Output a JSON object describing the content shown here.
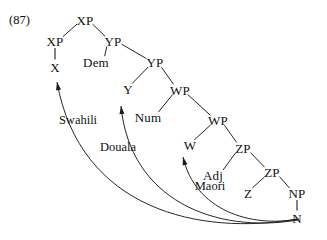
{
  "figure": {
    "example_number": "(87)",
    "caption": ""
  },
  "tree": {
    "nodes": [
      {
        "id": "xp_top",
        "label": "XP",
        "x": 85,
        "y": 20
      },
      {
        "id": "xp_spec",
        "label": "XP",
        "x": 55,
        "y": 41
      },
      {
        "id": "x_head",
        "label": "X",
        "x": 55,
        "y": 67
      },
      {
        "id": "yp_comp",
        "label": "YP",
        "x": 113,
        "y": 41
      },
      {
        "id": "dem",
        "label": "Dem",
        "x": 96,
        "y": 62
      },
      {
        "id": "yp_low",
        "label": "YP",
        "x": 155,
        "y": 62
      },
      {
        "id": "y_head",
        "label": "Y",
        "x": 128,
        "y": 89
      },
      {
        "id": "wp_hi",
        "label": "WP",
        "x": 180,
        "y": 90
      },
      {
        "id": "num",
        "label": "Num",
        "x": 148,
        "y": 117
      },
      {
        "id": "wp_low",
        "label": "WP",
        "x": 218,
        "y": 120
      },
      {
        "id": "w_head",
        "label": "W",
        "x": 190,
        "y": 145
      },
      {
        "id": "zp_hi",
        "label": "ZP",
        "x": 243,
        "y": 148
      },
      {
        "id": "adj",
        "label": "Adj",
        "x": 213,
        "y": 175
      },
      {
        "id": "zp_low",
        "label": "ZP",
        "x": 272,
        "y": 172
      },
      {
        "id": "z_head",
        "label": "Z",
        "x": 248,
        "y": 193
      },
      {
        "id": "np",
        "label": "NP",
        "x": 297,
        "y": 193
      },
      {
        "id": "n_head",
        "label": "N",
        "x": 297,
        "y": 218
      }
    ],
    "branches": [
      {
        "from": "xp_top",
        "to": "xp_spec"
      },
      {
        "from": "xp_top",
        "to": "yp_comp"
      },
      {
        "from": "xp_spec",
        "to": "x_head",
        "style": "stem"
      },
      {
        "from": "yp_comp",
        "to": "dem"
      },
      {
        "from": "yp_comp",
        "to": "yp_low"
      },
      {
        "from": "yp_low",
        "to": "y_head"
      },
      {
        "from": "yp_low",
        "to": "wp_hi"
      },
      {
        "from": "wp_hi",
        "to": "num"
      },
      {
        "from": "wp_hi",
        "to": "wp_low"
      },
      {
        "from": "wp_low",
        "to": "w_head"
      },
      {
        "from": "wp_low",
        "to": "zp_hi"
      },
      {
        "from": "zp_hi",
        "to": "adj"
      },
      {
        "from": "zp_hi",
        "to": "zp_low"
      },
      {
        "from": "zp_low",
        "to": "z_head"
      },
      {
        "from": "zp_low",
        "to": "np"
      },
      {
        "from": "np",
        "to": "n_head",
        "style": "stem"
      }
    ]
  },
  "movement_arcs": [
    {
      "id": "arc_swahili",
      "label": "Swahili",
      "label_x": 78,
      "label_y": 120,
      "from_node": "n_head",
      "to_node": "x_head",
      "path": "M 297 219 C 200 236, 80 210, 57 82"
    },
    {
      "id": "arc_douala",
      "label": "Douala",
      "label_x": 118,
      "label_y": 147,
      "from_node": "n_head",
      "to_node": "y_head",
      "path": "M 298 220 C 215 234, 130 200, 121 106"
    },
    {
      "id": "arc_maori",
      "label": "Maori",
      "label_x": 210,
      "label_y": 186,
      "from_node": "n_head",
      "to_node": "w_head",
      "path": "M 299 219 C 250 228, 195 210, 183 157"
    }
  ],
  "colors": {
    "line": "#1a1a1a",
    "text": "#111111",
    "background": "#ffffff"
  }
}
